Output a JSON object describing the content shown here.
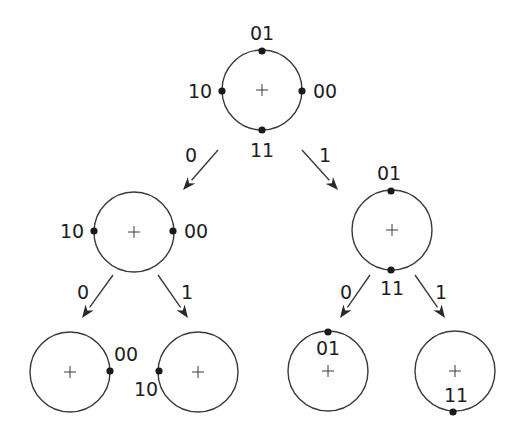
{
  "diagram": {
    "title": "",
    "colors": {
      "stroke": "#3a3a3a",
      "dot": "#1a1a1a",
      "text": "#1e1e1e",
      "background": "#ffffff"
    },
    "nodes": [
      {
        "id": "root",
        "cx": 262,
        "cy": 90,
        "r": 40,
        "points": [
          {
            "label": "01",
            "x": 262,
            "y": 51,
            "lx": 262,
            "ly": 40
          },
          {
            "label": "00",
            "x": 302,
            "y": 91,
            "lx": 325,
            "ly": 98
          },
          {
            "label": "11",
            "x": 262,
            "y": 130,
            "lx": 262,
            "ly": 157
          },
          {
            "label": "10",
            "x": 222,
            "y": 91,
            "lx": 200,
            "ly": 98
          }
        ]
      },
      {
        "id": "left",
        "cx": 134,
        "cy": 232,
        "r": 40,
        "points": [
          {
            "label": "10",
            "x": 94,
            "y": 231,
            "lx": 72,
            "ly": 238
          },
          {
            "label": "00",
            "x": 173,
            "y": 231,
            "lx": 196,
            "ly": 238
          }
        ]
      },
      {
        "id": "right",
        "cx": 392,
        "cy": 230,
        "r": 40,
        "points": [
          {
            "label": "01",
            "x": 391,
            "y": 191,
            "lx": 389,
            "ly": 180
          },
          {
            "label": "11",
            "x": 391,
            "y": 270,
            "lx": 392,
            "ly": 295
          }
        ]
      },
      {
        "id": "left-left",
        "cx": 70,
        "cy": 372,
        "r": 40,
        "points": [
          {
            "label": "00",
            "x": 110,
            "y": 371,
            "lx": 126,
            "ly": 361
          }
        ]
      },
      {
        "id": "left-right",
        "cx": 198,
        "cy": 372,
        "r": 40,
        "points": [
          {
            "label": "10",
            "x": 159,
            "y": 371,
            "lx": 146,
            "ly": 396
          }
        ]
      },
      {
        "id": "right-left",
        "cx": 328,
        "cy": 371,
        "r": 40,
        "points": [
          {
            "label": "01",
            "x": 328,
            "y": 332,
            "lx": 328,
            "ly": 355
          }
        ]
      },
      {
        "id": "right-right",
        "cx": 455,
        "cy": 371,
        "r": 40,
        "points": [
          {
            "label": "11",
            "x": 453,
            "y": 412,
            "lx": 456,
            "ly": 402
          }
        ]
      }
    ],
    "edges": [
      {
        "from": "root",
        "to": "left",
        "label": "0",
        "x1": 218,
        "y1": 150,
        "x2": 183,
        "y2": 190,
        "lx": 191,
        "ly": 162
      },
      {
        "from": "root",
        "to": "right",
        "label": "1",
        "x1": 302,
        "y1": 150,
        "x2": 338,
        "y2": 190,
        "lx": 325,
        "ly": 162
      },
      {
        "from": "left",
        "to": "left-left",
        "label": "0",
        "x1": 113,
        "y1": 275,
        "x2": 82,
        "y2": 318,
        "lx": 83,
        "ly": 299
      },
      {
        "from": "left",
        "to": "left-right",
        "label": "1",
        "x1": 158,
        "y1": 275,
        "x2": 188,
        "y2": 318,
        "lx": 187,
        "ly": 299
      },
      {
        "from": "right",
        "to": "right-left",
        "label": "0",
        "x1": 370,
        "y1": 275,
        "x2": 340,
        "y2": 318,
        "lx": 346,
        "ly": 299
      },
      {
        "from": "right",
        "to": "right-right",
        "label": "1",
        "x1": 415,
        "y1": 275,
        "x2": 445,
        "y2": 318,
        "lx": 441,
        "ly": 299
      }
    ]
  }
}
